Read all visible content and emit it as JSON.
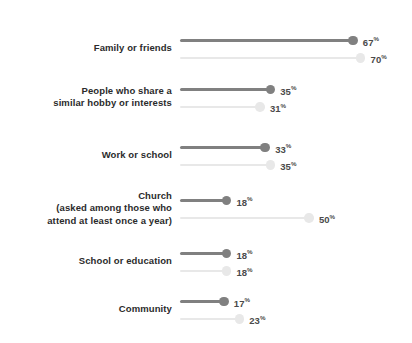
{
  "chart_data": {
    "type": "bar",
    "title": "",
    "subtitle": "",
    "xlabel": "",
    "ylabel": "",
    "grid": false,
    "legend_position": "none",
    "value_suffix": "%",
    "xlim": [
      0,
      70
    ],
    "categories": [
      "Family or friends",
      "People who share a similar hobby or interests",
      "Work or school",
      "Church (asked among those who attend at least once a year)",
      "School or education",
      "Community"
    ],
    "series": [
      {
        "name": "dark",
        "color": "#808080",
        "values": [
          67,
          35,
          33,
          18,
          18,
          17
        ]
      },
      {
        "name": "light",
        "color": "#e8e8e8",
        "values": [
          70,
          31,
          35,
          50,
          18,
          23
        ]
      }
    ]
  },
  "rows": [
    {
      "label_lines": [
        "Family or friends"
      ],
      "dark": {
        "value": 67,
        "value_text": "67",
        "suffix": "%"
      },
      "light": {
        "value": 70,
        "value_text": "70",
        "suffix": "%"
      }
    },
    {
      "label_lines": [
        "People who share a",
        "similar hobby or interests"
      ],
      "dark": {
        "value": 35,
        "value_text": "35",
        "suffix": "%"
      },
      "light": {
        "value": 31,
        "value_text": "31",
        "suffix": "%"
      }
    },
    {
      "label_lines": [
        "Work or school"
      ],
      "dark": {
        "value": 33,
        "value_text": "33",
        "suffix": "%"
      },
      "light": {
        "value": 35,
        "value_text": "35",
        "suffix": "%"
      }
    },
    {
      "label_lines": [
        "Church",
        "(asked among those who",
        "attend at least once a year)"
      ],
      "dark": {
        "value": 18,
        "value_text": "18",
        "suffix": "%"
      },
      "light": {
        "value": 50,
        "value_text": "50",
        "suffix": "%"
      }
    },
    {
      "label_lines": [
        "School or education"
      ],
      "dark": {
        "value": 18,
        "value_text": "18",
        "suffix": "%"
      },
      "light": {
        "value": 18,
        "value_text": "18",
        "suffix": "%"
      }
    },
    {
      "label_lines": [
        "Community"
      ],
      "dark": {
        "value": 17,
        "value_text": "17",
        "suffix": "%"
      },
      "light": {
        "value": 23,
        "value_text": "23",
        "suffix": "%"
      }
    }
  ],
  "colors": {
    "dark_series": "#808080",
    "light_series": "#e8e8e8",
    "label_text": "#2b2b2b",
    "value_text_dark": "#4a4a4a",
    "value_text_light": "#6e6e6e",
    "background": "#ffffff"
  },
  "layout": {
    "bar_origin_x": 180,
    "px_per_unit": 2.58,
    "row_tops": [
      39,
      88,
      146,
      199,
      252,
      300
    ],
    "series_gap": 17.5,
    "label_anchor_y_offsets": [
      -6,
      -12,
      -6,
      -18,
      -6,
      -6
    ]
  }
}
